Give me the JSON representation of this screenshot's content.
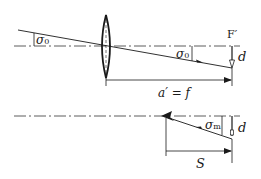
{
  "diagram": {
    "top_panel": {
      "angle_left_label": "σ",
      "angle_left_sub": "0",
      "angle_right_label": "σ",
      "angle_right_sub": "0",
      "focal_point_label": "F′",
      "displacement_label": "d",
      "distance_label": "a′ = f"
    },
    "bottom_panel": {
      "angle_label": "σ",
      "angle_sub": "m",
      "displacement_label": "d",
      "distance_label": "S"
    },
    "colors": {
      "line": "#1a1a1a",
      "background": "#ffffff"
    }
  }
}
